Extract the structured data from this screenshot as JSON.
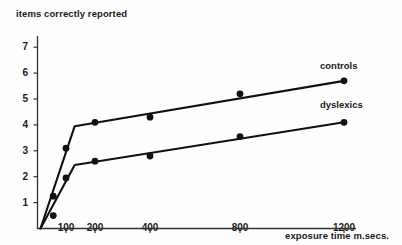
{
  "chart_data": {
    "type": "line",
    "title": "",
    "subtitle": "",
    "xlabel": "exposure time m.secs.",
    "ylabel": "items correctly reported",
    "grid": false,
    "legend_position": "inline-right-of-line-ends",
    "x_scale": "custom-compressed",
    "x_ticks": [
      100,
      200,
      400,
      800,
      1200
    ],
    "x_tick_labels": [
      "100",
      "200",
      "400",
      "800",
      "1200"
    ],
    "y_ticks": [
      1,
      2,
      3,
      4,
      5,
      6,
      7
    ],
    "y_tick_labels": [
      "1",
      "2",
      "3",
      "4",
      "5",
      "6",
      "7"
    ],
    "ylim": [
      0,
      7.6
    ],
    "series": [
      {
        "name": "controls",
        "label": "controls",
        "color": "#111111",
        "x": [
          50,
          70,
          100,
          130,
          200,
          400,
          800,
          1200
        ],
        "values": [
          0.45,
          1.25,
          3.1,
          3.95,
          4.1,
          4.3,
          5.2,
          5.7
        ],
        "fit_x": [
          40,
          130,
          1200
        ],
        "fit_values": [
          0.0,
          3.95,
          5.7
        ],
        "marker_x": [
          70,
          100,
          200,
          400,
          800,
          1200
        ],
        "marker_values": [
          1.25,
          3.1,
          4.1,
          4.3,
          5.2,
          5.7
        ]
      },
      {
        "name": "dyslexics",
        "label": "dyslexics",
        "color": "#111111",
        "x": [
          70,
          100,
          130,
          200,
          400,
          800,
          1200
        ],
        "values": [
          0.5,
          1.95,
          2.45,
          2.6,
          2.8,
          3.55,
          4.1
        ],
        "fit_x": [
          40,
          130,
          1200
        ],
        "fit_values": [
          0.0,
          2.45,
          4.1
        ],
        "marker_x": [
          70,
          100,
          200,
          400,
          800,
          1200
        ],
        "marker_values": [
          0.5,
          1.95,
          2.6,
          2.8,
          3.55,
          4.1
        ]
      }
    ]
  },
  "axes": {
    "y_title": "items correctly reported",
    "x_title": "exposure time m.secs.",
    "y_labels": [
      "7",
      "6",
      "5",
      "4",
      "3",
      "2",
      "1"
    ],
    "x_labels": [
      "100",
      "200",
      "400",
      "800",
      "1200"
    ]
  },
  "series_labels": {
    "controls": "controls",
    "dyslexics": "dyslexics"
  },
  "colors": {
    "line": "#111111",
    "marker": "#111111",
    "axis": "#333333",
    "text": "#1a1a1a",
    "background": "#fefefe"
  }
}
